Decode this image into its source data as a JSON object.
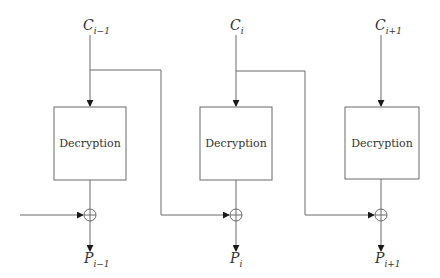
{
  "diagram": {
    "stages": [
      {
        "input_label": "C",
        "input_sub": "i−1",
        "box_label": "Decryption",
        "output_label": "P",
        "output_sub": "i−1"
      },
      {
        "input_label": "C",
        "input_sub": "i",
        "box_label": "Decryption",
        "output_label": "P",
        "output_sub": "i"
      },
      {
        "input_label": "C",
        "input_sub": "i+1",
        "box_label": "Decryption",
        "output_label": "P",
        "output_sub": "i+1"
      }
    ],
    "operator_icon": "xor-circle-plus",
    "colors": {
      "line": "#6b6b6b",
      "arrow": "#1a1a1a",
      "text": "#333333"
    }
  }
}
